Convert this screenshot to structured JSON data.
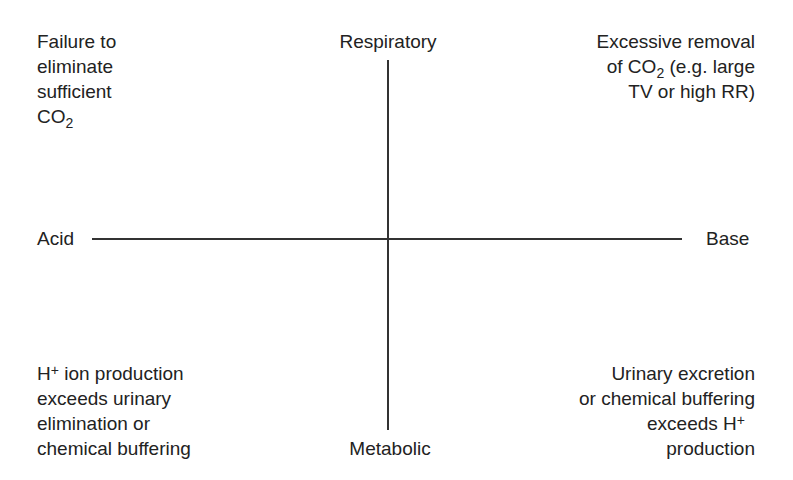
{
  "axes": {
    "top": "Respiratory",
    "bottom": "Metabolic",
    "left": "Acid",
    "right": "Base"
  },
  "quadrants": {
    "top_left": {
      "lines": [
        "Failure to",
        "eliminate",
        "sufficient"
      ],
      "formula_main": "CO",
      "formula_sub": "2"
    },
    "top_right": {
      "line1": "Excessive removal",
      "line2_pre": "of CO",
      "line2_sub": "2",
      "line2_post": " (e.g. large",
      "line3": "TV or high RR)"
    },
    "bottom_left": {
      "line1_main": "H",
      "line1_sup": "+",
      "line1_post": " ion production",
      "line2": "exceeds urinary",
      "line3": "elimination or",
      "line4": "chemical buffering"
    },
    "bottom_right": {
      "line1": "Urinary excretion",
      "line2": "or chemical buffering",
      "line3_pre": "exceeds H",
      "line3_sup": "+",
      "line4": "production"
    }
  }
}
